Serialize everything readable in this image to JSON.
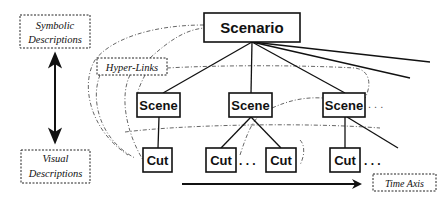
{
  "diagram": {
    "root": {
      "label": "Scenario"
    },
    "scenes": [
      {
        "label": "Scene"
      },
      {
        "label": "Scene"
      },
      {
        "label": "Scene"
      }
    ],
    "cuts": [
      {
        "label": "Cut"
      },
      {
        "label": "Cut"
      },
      {
        "label": "Cut"
      },
      {
        "label": "Cut"
      }
    ],
    "ellipsis": ". . .",
    "annotations": {
      "symbolic": {
        "line1": "Symbolic",
        "line2": "Descriptions"
      },
      "visual": {
        "line1": "Visual",
        "line2": "Descriptions"
      },
      "hyperlinks": "Hyper-Links",
      "time_axis": "Time Axis"
    },
    "colors": {
      "stroke": "#111111",
      "dashed": "#555555",
      "background": "#ffffff"
    }
  }
}
